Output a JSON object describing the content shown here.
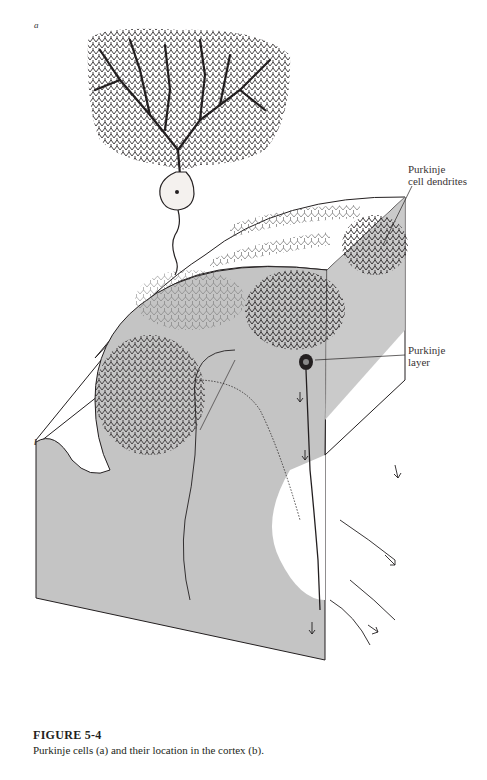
{
  "figure": {
    "panel_labels": {
      "a": "a",
      "b": "b"
    },
    "callouts": {
      "dendrites_line1": "Purkinje",
      "dendrites_line2": "cell dendrites",
      "layer_line1": "Purkinje",
      "layer_line2": "layer"
    },
    "caption": {
      "title": "FIGURE 5-4",
      "text": "Purkinje cells (a) and their location in the cortex (b)."
    },
    "colors": {
      "ink": "#231f20",
      "gray_fill": "#c4c4c4",
      "paper": "#ffffff"
    }
  }
}
